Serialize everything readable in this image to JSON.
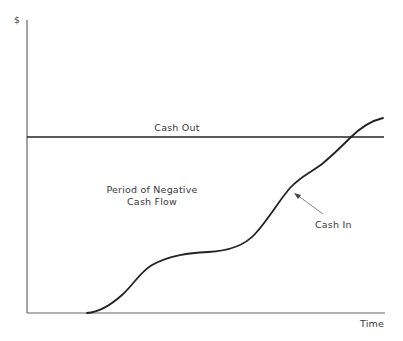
{
  "diagram": {
    "type": "cash-flow-diagram",
    "axes": {
      "y_label": "$",
      "x_label": "Time"
    },
    "labels": {
      "cash_out": "Cash Out",
      "negative_period_line1": "Period of Negative",
      "negative_period_line2": "Cash Flow",
      "cash_in": "Cash In"
    },
    "series": [
      {
        "name": "Cash Out",
        "shape": "horizontal line",
        "description": "constant level"
      },
      {
        "name": "Cash In",
        "shape": "S-shaped cumulative curve",
        "description": "starts at zero after a delay, rises, plateaus, rises again and crosses Cash Out near the end"
      }
    ],
    "colors": {
      "line": "#222222",
      "axis": "#555555",
      "text": "#3a3a3a",
      "background": "#ffffff"
    }
  }
}
